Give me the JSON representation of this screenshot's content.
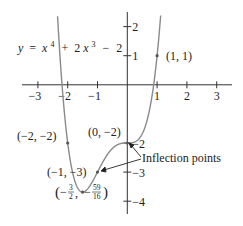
{
  "chart_data": {
    "type": "line",
    "title": "",
    "equation": {
      "y": "y",
      "eq": "=",
      "x": "x",
      "exp4": "4",
      "plus": "+",
      "coef": "2",
      "x2": "x",
      "exp3": "3",
      "minus": "−",
      "const": "2"
    },
    "function": "x^4 + 2x^3 - 2",
    "xlim": [
      -3.3,
      3.3
    ],
    "ylim": [
      -4.4,
      2.5
    ],
    "x_ticks": [
      {
        "value": -3,
        "label": "−3"
      },
      {
        "value": -2,
        "label": "−2"
      },
      {
        "value": -1,
        "label": "−1"
      },
      {
        "value": 1,
        "label": "1"
      },
      {
        "value": 2,
        "label": "2"
      },
      {
        "value": 3,
        "label": "3"
      }
    ],
    "y_ticks": [
      {
        "value": 2,
        "label": "2"
      },
      {
        "value": 1,
        "label": "1"
      },
      {
        "value": -2,
        "label": "−2"
      },
      {
        "value": -3,
        "label": "−3"
      },
      {
        "value": -4,
        "label": "−4"
      }
    ],
    "points": [
      {
        "x": 1,
        "y": 1,
        "label": "(1, 1)"
      },
      {
        "x": -2,
        "y": -2,
        "label": "(−2, −2)"
      },
      {
        "x": 0,
        "y": -2,
        "label": "(0, −2)"
      },
      {
        "x": -1,
        "y": -3,
        "label": "(−1, −3)"
      },
      {
        "x": -1.5,
        "y": -3.6875,
        "label": "(−3/2, −59/16)"
      }
    ],
    "minimum": {
      "x_num": "3",
      "x_den": "2",
      "y_num": "59",
      "y_den": "16",
      "open": "(−",
      "comma": ",",
      "neg": "−",
      "close": ")"
    },
    "annotation": "Inflection points",
    "grid": false,
    "legend": "none"
  },
  "colors": {
    "axis": "#333333",
    "curve": "#8a8a8a",
    "text": "#222222"
  }
}
